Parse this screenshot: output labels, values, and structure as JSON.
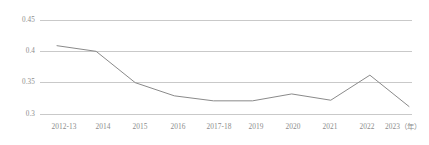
{
  "chart_data": {
    "type": "line",
    "title": "",
    "subtitle": "",
    "xlabel": "年",
    "ylabel": "",
    "categories": [
      "2012-13",
      "2014",
      "2015",
      "2016",
      "2017-18",
      "2019",
      "2020",
      "2021",
      "2022",
      "2023"
    ],
    "x_tick_labels": [
      "2012-13",
      "2014",
      "2015",
      "2016",
      "2017-18",
      "2019",
      "2020",
      "2021",
      "2022",
      "2023（年）"
    ],
    "series": [
      {
        "name": "",
        "values": [
          0.409,
          0.4,
          0.35,
          0.329,
          0.321,
          0.321,
          0.332,
          0.322,
          0.362,
          0.312
        ]
      }
    ],
    "y_tick_labels": [
      "0.45",
      "0.4",
      "0.35",
      "0.3"
    ],
    "y_tick_values": [
      0.45,
      0.4,
      0.35,
      0.3
    ],
    "ylim": [
      0.3,
      0.45
    ],
    "grid": "horizontal",
    "legend": "none",
    "colors": {
      "line": "#8a8a8a",
      "gridline": "#c9c9c9",
      "tick_text": "#8c8c8c",
      "background": "#ffffff"
    },
    "markers": false,
    "line_width": 1
  },
  "axis": {
    "y_labels": [
      "0.45",
      "0.4",
      "0.35",
      "0.3"
    ],
    "x_labels": [
      "2012-13",
      "2014",
      "2015",
      "2016",
      "2017-18",
      "2019",
      "2020",
      "2021",
      "2022",
      "2023（年）"
    ]
  }
}
